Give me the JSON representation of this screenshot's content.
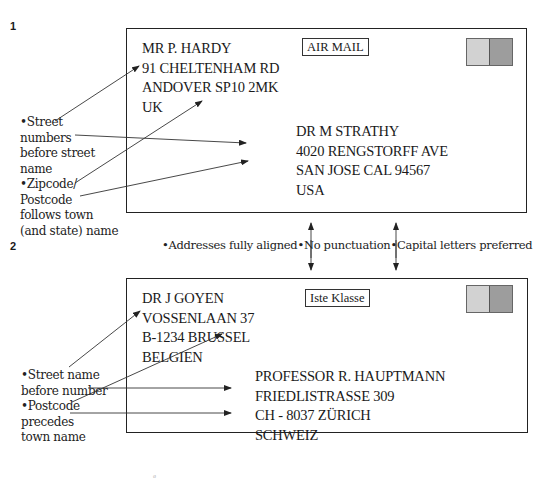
{
  "figure_labels": [
    "1",
    "2"
  ],
  "envelope_1": {
    "service_tag": "AIR MAIL",
    "sender": [
      "MR P. HARDY",
      "91 CHELTENHAM RD",
      "ANDOVER SP10 2MK",
      "UK"
    ],
    "recipient": [
      "DR M STRATHY",
      "4020 RENGSTORFF AVE",
      "SAN JOSE CAL 94567",
      "USA"
    ],
    "notes": [
      "•Street",
      "numbers",
      "before street",
      "name",
      "•Zipcode/",
      "Postcode",
      "follows town",
      "(and state) name"
    ],
    "stamp_colors": [
      "#d2d2d2",
      "#9d9d9d"
    ]
  },
  "caption": "•Addresses fully aligned•No punctuation•Capital letters preferred",
  "envelope_2": {
    "service_tag": "Iste Klasse",
    "sender": [
      "DR J GOYEN",
      "VOSSENLAAN 37",
      "B-1234 BRUSSEL",
      "BELGIEN"
    ],
    "recipient": [
      "PROFESSOR R. HAUPTMANN",
      "FRIEDLISTRASSE 309",
      "CH - 8037 ZÜRICH",
      "SCHWEIZ"
    ],
    "notes": [
      "•Street name",
      "before number",
      "•Postcode",
      "precedes",
      "town name"
    ],
    "stamp_colors": [
      "#d2d2d2",
      "#9d9d9d"
    ]
  }
}
